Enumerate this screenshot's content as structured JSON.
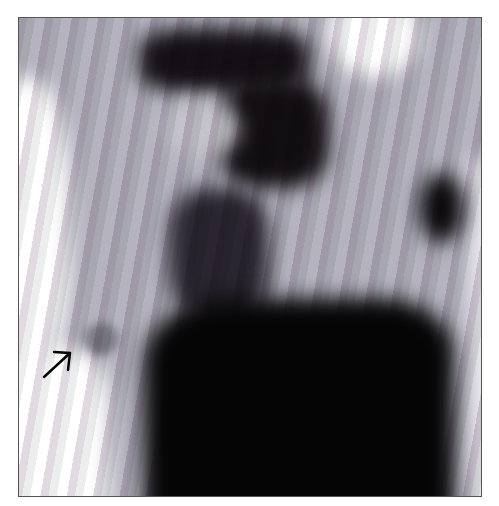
{
  "image": {
    "description": "Grayscale scintigraphy-style medical image with a dark central region and a small focal uptake marked by an arrow",
    "annotation": {
      "type": "arrow",
      "direction": "up-right",
      "target": "focal uptake spot lower-left"
    },
    "colors": {
      "background": "#ffffff",
      "tissue": "#b4b3bf",
      "dark": "#0a0a0c",
      "border": "#555555"
    }
  }
}
